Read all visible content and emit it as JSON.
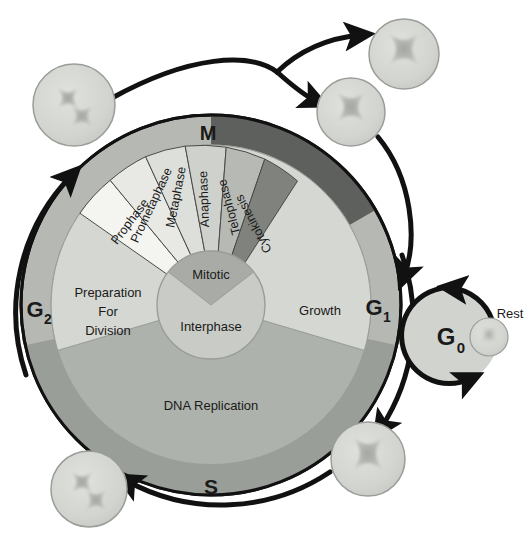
{
  "diagram": {
    "center": {
      "mitotic_label": "Mitotic",
      "interphase_label": "Interphase"
    },
    "inner_quadrants": [
      {
        "key": "growth",
        "label": "Growth",
        "color": "#d5d7d2"
      },
      {
        "key": "dna",
        "label": "DNA Replication",
        "color": "#aeb2ac"
      },
      {
        "key": "preparation",
        "label": "Preparation\nFor\nDivision",
        "lines": [
          "Preparation",
          "For",
          "Division"
        ],
        "color": "#d5d7d2"
      }
    ],
    "outer_ring_segments": [
      {
        "key": "g1",
        "label": "G",
        "sub": "1",
        "color": "#b6b9b3"
      },
      {
        "key": "s",
        "label": "S",
        "sub": "",
        "color": "#9a9e98"
      },
      {
        "key": "g2",
        "label": "G",
        "sub": "2",
        "color": "#b6b9b3"
      },
      {
        "key": "m",
        "label": "M",
        "sub": "",
        "color": "#5d605c"
      }
    ],
    "mitotic_phases": [
      {
        "key": "prophase",
        "label": "Prophase",
        "color": "#f2f2ef"
      },
      {
        "key": "prometaphase",
        "label": "Prometaphase",
        "color": "#e6e7e3"
      },
      {
        "key": "metaphase",
        "label": "Metaphase",
        "color": "#dcdeda"
      },
      {
        "key": "anaphase",
        "label": "Anaphase",
        "color": "#d0d2ce"
      },
      {
        "key": "telophase",
        "label": "Telophase",
        "color": "#b9bcb7"
      },
      {
        "key": "cytokinesis",
        "label": "Cytokinesis",
        "color": "#84standin"
      }
    ],
    "mitotic_phase_colors": [
      "#f4f4f1",
      "#e8e9e5",
      "#dddfdb",
      "#cfd1cd",
      "#b6b9b4",
      "#7f827d"
    ],
    "g0": {
      "label": "G",
      "sub": "0",
      "rest_label": "Rest"
    },
    "cells": [
      {
        "key": "cell-top-left",
        "chromosomes": 2,
        "r": 41,
        "cx": 74,
        "cy": 105
      },
      {
        "key": "cell-top-right",
        "chromosomes": 1,
        "r": 35,
        "cx": 404,
        "cy": 54
      },
      {
        "key": "cell-mid-right",
        "chromosomes": 1,
        "r": 34,
        "cx": 351,
        "cy": 112
      },
      {
        "key": "cell-bottom-right",
        "chromosomes": 1,
        "r": 37,
        "cx": 368,
        "cy": 459
      },
      {
        "key": "cell-bottom-left",
        "chromosomes": 2,
        "r": 38,
        "cx": 89,
        "cy": 489
      },
      {
        "key": "cell-g0",
        "chromosomes": 1,
        "r": 19,
        "cx": 489,
        "cy": 337
      }
    ],
    "colors": {
      "outline": "#111111",
      "ring_light": "#b6b9b3",
      "ring_dark": "#5d605c",
      "ring_s": "#9a9e98",
      "inner_light": "#d5d7d2",
      "inner_mid": "#aeb2ac",
      "center_fill": "#c9ccc6",
      "mitotic_wedge": "#a9aca6",
      "cell_fill": "#d2d4cf",
      "chromosome": "#b0b3ae",
      "text": "#1a1a1a"
    }
  }
}
